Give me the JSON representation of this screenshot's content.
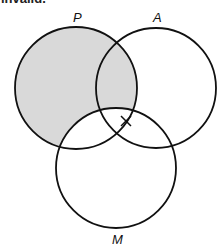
{
  "caption": "invalid.",
  "diagram": {
    "type": "venn",
    "sets": [
      {
        "label": "P",
        "cx": 76,
        "cy": 88,
        "r": 61
      },
      {
        "label": "A",
        "cx": 156,
        "cy": 88,
        "r": 60
      },
      {
        "label": "M",
        "cx": 116,
        "cy": 168,
        "r": 60
      }
    ],
    "shaded_region": "P minus M",
    "shade_color": "#d9d9d9",
    "stroke_color": "#111111",
    "mark": {
      "symbol": "X",
      "x": 126,
      "y": 121,
      "location": "on boundary of A within P and M"
    }
  },
  "labels": {
    "p": "P",
    "a": "A",
    "m": "M"
  }
}
